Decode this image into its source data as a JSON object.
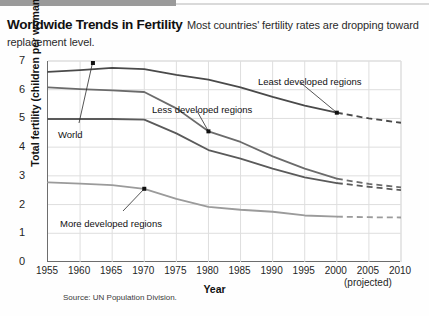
{
  "caption": {
    "title": "Worldwide Trends in Fertility",
    "body": "Most countries' fertility rates are dropping toward replacement level."
  },
  "source": "Source: UN Population Division.",
  "colors": {
    "least_developed": "#4a4a4a",
    "less_developed": "#6b6b6b",
    "world": "#5a5a5a",
    "more_developed": "#9b9b9b",
    "axis": "#6d6d6d",
    "grid": "#dedede",
    "band": "#9a9a9a"
  },
  "annotations": [
    {
      "label": "Least developed regions",
      "x": 258,
      "y": 76
    },
    {
      "label": "Less developed regions",
      "x": 152,
      "y": 104
    },
    {
      "label": "World",
      "x": 58,
      "y": 129
    },
    {
      "label": "More developed regions",
      "x": 60,
      "y": 218
    }
  ],
  "chart_data": {
    "type": "line",
    "title": "Worldwide Trends in Fertility",
    "xlabel": "Year",
    "ylabel": "Total fertility (children per woman)",
    "xlim": [
      1955,
      2010
    ],
    "ylim": [
      0,
      7
    ],
    "xticks": [
      1955,
      1960,
      1965,
      1970,
      1975,
      1980,
      1985,
      1990,
      1995,
      2000,
      2005,
      2010
    ],
    "yticks": [
      0,
      1,
      2,
      3,
      4,
      5,
      6,
      7
    ],
    "grid": true,
    "legend": "inline-annotations",
    "projection_note": "(projected)",
    "projection_starts": 2000,
    "x": [
      1955,
      1960,
      1965,
      1970,
      1975,
      1980,
      1985,
      1990,
      1995,
      2000,
      2005,
      2010
    ],
    "series": [
      {
        "name": "Least developed regions",
        "values": [
          6.62,
          6.68,
          6.76,
          6.72,
          6.52,
          6.35,
          6.08,
          5.75,
          5.45,
          5.2,
          5.0,
          4.85
        ],
        "color": "#4a4a4a",
        "dashed_from": 2000
      },
      {
        "name": "Less developed regions",
        "values": [
          6.08,
          6.02,
          5.98,
          5.92,
          5.35,
          4.55,
          4.18,
          3.68,
          3.25,
          2.9,
          2.72,
          2.6
        ],
        "color": "#6b6b6b",
        "dashed_from": 2000
      },
      {
        "name": "World",
        "values": [
          4.98,
          4.98,
          4.98,
          4.96,
          4.48,
          3.9,
          3.6,
          3.25,
          2.95,
          2.75,
          2.62,
          2.5
        ],
        "color": "#5a5a5a",
        "dashed_from": 2000
      },
      {
        "name": "More developed regions",
        "values": [
          2.77,
          2.73,
          2.68,
          2.55,
          2.2,
          1.92,
          1.82,
          1.75,
          1.62,
          1.58,
          1.56,
          1.55
        ],
        "color": "#9b9b9b",
        "dashed_from": 2000
      }
    ]
  }
}
